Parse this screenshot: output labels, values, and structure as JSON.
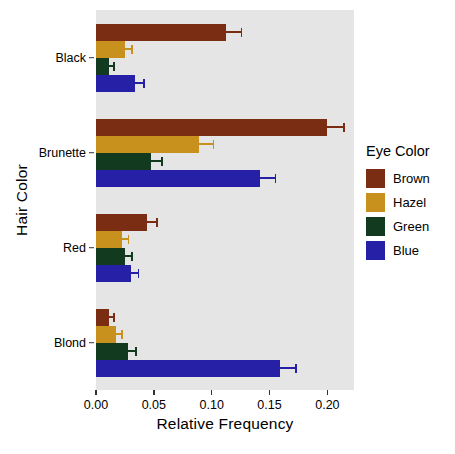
{
  "chart_data": {
    "type": "bar",
    "orientation": "horizontal",
    "title": "",
    "xlabel": "Relative Frequency",
    "ylabel": "Hair Color",
    "categories": [
      "Black",
      "Brunette",
      "Red",
      "Blond"
    ],
    "legend_title": "Eye Color",
    "legend_position": "right",
    "grid": false,
    "xlim": [
      0.0,
      0.223
    ],
    "xticks": [
      0.0,
      0.05,
      0.1,
      0.15,
      0.2
    ],
    "xticklabels": [
      "0.00",
      "0.05",
      "0.10",
      "0.15",
      "0.20"
    ],
    "series": [
      {
        "name": "Brown",
        "color": "#7B2D14",
        "values": [
          0.112,
          0.2,
          0.0437,
          0.011
        ],
        "errors": [
          0.0143,
          0.015,
          0.0095,
          0.005
        ]
      },
      {
        "name": "Hazel",
        "color": "#C8901C",
        "values": [
          0.025,
          0.0887,
          0.0225,
          0.0175
        ],
        "errors": [
          0.007,
          0.0135,
          0.0063,
          0.0058
        ]
      },
      {
        "name": "Green",
        "color": "#123A1E",
        "values": [
          0.011,
          0.0475,
          0.025,
          0.028
        ],
        "errors": [
          0.005,
          0.01,
          0.007,
          0.0075
        ]
      },
      {
        "name": "Blue",
        "color": "#2620A6",
        "values": [
          0.034,
          0.142,
          0.03,
          0.159
        ],
        "errors": [
          0.008,
          0.014,
          0.0075,
          0.0145
        ]
      }
    ]
  },
  "axis_colors": {
    "panel_background": "#E5E5E5",
    "tick_color": "#333333",
    "text_color": "#000000"
  }
}
